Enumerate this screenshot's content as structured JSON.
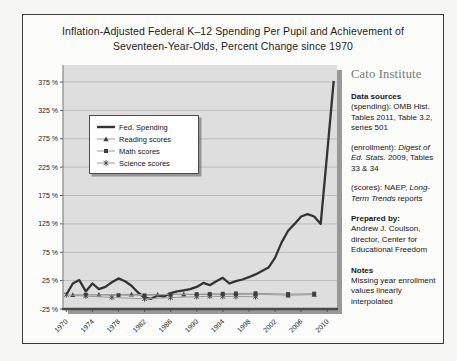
{
  "header": {
    "title_line1": "Inflation-Adjusted Federal K–12 Spending Per Pupil and Achievement of",
    "title_line2": "Seventeen-Year-Olds, Percent Change since 1970"
  },
  "chart_data": {
    "type": "line",
    "title": "Inflation-Adjusted Federal K–12 Spending Per Pupil and Achievement of Seventeen-Year-Olds, Percent Change since 1970",
    "xlabel": "",
    "ylabel": "",
    "ylim": [
      -25,
      405
    ],
    "x_start_year": 1970,
    "x_slots": 42,
    "grid": true,
    "plot_bg": "#dedede",
    "grid_color": "#b3b3b3",
    "axis_color": "#4a4a4a",
    "shadow_color": "#999999",
    "y_gridline_values": [
      25,
      75,
      125,
      175,
      225,
      275,
      325,
      375
    ],
    "y_ticks": [
      {
        "v": 375,
        "label": "375 %"
      },
      {
        "v": 325,
        "label": "325 %"
      },
      {
        "v": 275,
        "label": "275 %"
      },
      {
        "v": 225,
        "label": "225 %"
      },
      {
        "v": 175,
        "label": "175 %"
      },
      {
        "v": 125,
        "label": "125 %"
      },
      {
        "v": 75,
        "label": "75 %"
      },
      {
        "v": 25,
        "label": "25 %"
      },
      {
        "v": -25,
        "label": "-25 %"
      }
    ],
    "x_ticks": [
      1970,
      1974,
      1978,
      1982,
      1986,
      1990,
      1994,
      1998,
      2002,
      2006,
      2010
    ],
    "series": [
      {
        "name": "Fed. Spending",
        "marker": "none",
        "color": "#333333",
        "width": 2.3,
        "years": [
          1970,
          1971,
          1972,
          1973,
          1974,
          1975,
          1976,
          1977,
          1978,
          1979,
          1980,
          1981,
          1982,
          1983,
          1984,
          1985,
          1986,
          1987,
          1988,
          1989,
          1990,
          1991,
          1992,
          1993,
          1994,
          1995,
          1996,
          1997,
          1998,
          1999,
          2000,
          2001,
          2002,
          2003,
          2004,
          2005,
          2006,
          2007,
          2008,
          2009,
          2010,
          2011
        ],
        "values": [
          0,
          20,
          26,
          6,
          20,
          10,
          14,
          22,
          29,
          24,
          16,
          4,
          -5,
          -7,
          -1,
          -3,
          3,
          6,
          8,
          10,
          14,
          21,
          17,
          24,
          30,
          20,
          24,
          27,
          31,
          36,
          42,
          48,
          65,
          92,
          113,
          125,
          138,
          142,
          138,
          125,
          250,
          377
        ]
      },
      {
        "name": "Reading scores",
        "marker": "triangle",
        "color": "#9a9a9a",
        "width": 1,
        "marker_color": "#3f3f3f",
        "years": [
          1971,
          1975,
          1980,
          1984,
          1988,
          1990,
          1992,
          1994,
          1996,
          1999,
          2004,
          2008
        ],
        "values": [
          0,
          0.4,
          0.7,
          0.3,
          1,
          0.4,
          1,
          0.7,
          0.7,
          1,
          -0.7,
          0.3
        ]
      },
      {
        "name": "Math scores",
        "marker": "square",
        "color": "#9a9a9a",
        "width": 1,
        "marker_color": "#3f3f3f",
        "years": [
          1973,
          1978,
          1982,
          1986,
          1990,
          1992,
          1994,
          1996,
          1999,
          2004,
          2008
        ],
        "values": [
          0,
          -0.7,
          -1,
          0.7,
          1,
          1.3,
          1.7,
          2.3,
          2.7,
          1.3,
          2
        ]
      },
      {
        "name": "Science scores",
        "marker": "star",
        "color": "#9a9a9a",
        "width": 1,
        "marker_color": "#3f3f3f",
        "years": [
          1970,
          1973,
          1977,
          1982,
          1986,
          1990,
          1992,
          1994,
          1996,
          1999
        ],
        "values": [
          0,
          -2.3,
          -4.6,
          -7.2,
          -4.9,
          -3.3,
          -2.6,
          -3,
          -3,
          -3.3
        ]
      }
    ],
    "legend_position": "upper-left-inside"
  },
  "legend": {
    "items": [
      {
        "label": "Fed. Spending",
        "marker": "line"
      },
      {
        "label": "Reading scores",
        "marker": "triangle"
      },
      {
        "label": "Math scores",
        "marker": "square"
      },
      {
        "label": "Science scores",
        "marker": "star"
      }
    ]
  },
  "side_panel": {
    "brand": "Cato Institute",
    "sections": [
      {
        "heading": "Data sources",
        "paras": [
          [
            {
              "t": "(spending): OMB Hist. Tables 2011, Table 3.2, series 501"
            }
          ],
          [
            {
              "t": "(enrollment): "
            },
            {
              "t": "Digest of Ed. Stats.",
              "i": true
            },
            {
              "t": " 2009, Tables 33 & 34"
            }
          ],
          [
            {
              "t": "(scores): NAEP, "
            },
            {
              "t": "Long-Term Trends",
              "i": true
            },
            {
              "t": " reports"
            }
          ]
        ]
      },
      {
        "heading": "Prepared by:",
        "paras": [
          [
            {
              "t": "Andrew J. Coulson, director, Center for Educational Freedom"
            }
          ]
        ]
      },
      {
        "heading": "Notes",
        "paras": [
          [
            {
              "t": "Missing year enrollment values linearly interpolated"
            }
          ]
        ]
      }
    ]
  }
}
